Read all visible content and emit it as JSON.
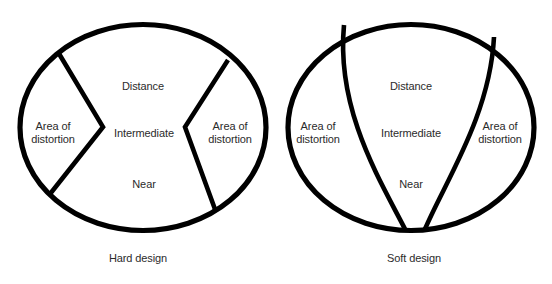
{
  "figure": {
    "background_color": "#ffffff",
    "line_color": "#000000",
    "text_color": "#2b2b2b",
    "panels": [
      {
        "id": "hard",
        "caption": "Hard design",
        "labels": {
          "distance": "Distance",
          "intermediate": "Intermediate",
          "near": "Near",
          "distortion_left": "Area of\ndistortion",
          "distortion_right": "Area of\ndistortion"
        }
      },
      {
        "id": "soft",
        "caption": "Soft design",
        "labels": {
          "distance": "Distance",
          "intermediate": "Intermediate",
          "near": "Near",
          "distortion_left": "Area of\ndistortion",
          "distortion_right": "Area of\ndistortion"
        }
      }
    ]
  }
}
